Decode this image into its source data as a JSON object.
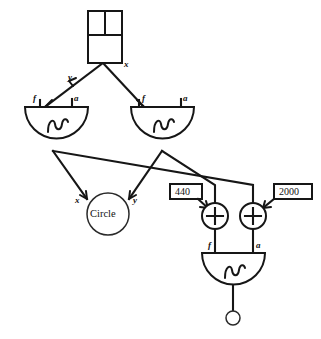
{
  "diagram": {
    "stroke_color": "#161616",
    "background_color": "#ffffff",
    "nodes": {
      "source_box": {
        "name": "subdivided-box",
        "output_label": "x",
        "cells": [
          "",
          "",
          ""
        ]
      },
      "osc_left": {
        "name": "sine-oscillator-left",
        "glyph": "sine-wave-icon",
        "input_f": "f",
        "input_a": "a"
      },
      "osc_right": {
        "name": "sine-oscillator-right",
        "glyph": "sine-wave-icon",
        "input_f": "f",
        "input_a": "a"
      },
      "circle_node": {
        "name": "circle-node",
        "label": "Circle",
        "input_x": "x",
        "input_y": "y"
      },
      "const_440": {
        "name": "constant-box-440",
        "value": "440"
      },
      "const_2000": {
        "name": "constant-box-2000",
        "value": "2000"
      },
      "adder_left": {
        "name": "adder-left",
        "symbol": "+"
      },
      "adder_right": {
        "name": "adder-right",
        "symbol": "+"
      },
      "osc_bottom": {
        "name": "sine-oscillator-bottom",
        "glyph": "sine-wave-icon",
        "input_f": "f",
        "input_a": "a"
      },
      "output_node": {
        "name": "output-terminal",
        "label": ""
      }
    },
    "edge_labels": {
      "box_to_left_osc": "y",
      "box_to_right_osc": "x"
    }
  }
}
